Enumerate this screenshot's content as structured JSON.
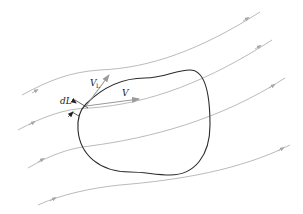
{
  "diagram": {
    "labels": {
      "v_l_main": "V",
      "v_l_sub": "L",
      "v": "V",
      "dl": "dL"
    },
    "colors": {
      "streamline": "#a8a8a8",
      "contour": "#2a2a2a",
      "vector": "#9a9a9a",
      "text": "#222222"
    },
    "streamline_count": 4
  }
}
